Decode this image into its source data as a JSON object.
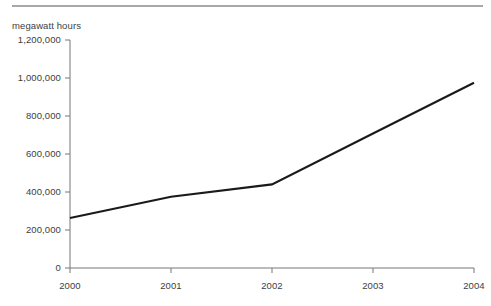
{
  "figure": {
    "background_color": "#ffffff",
    "rule_color": "#a8a8a8",
    "axis_color": "#777777",
    "line_color": "#1a1a1a",
    "text_color": "#3d3d3d"
  },
  "chart_data": {
    "type": "line",
    "title": "",
    "subtitle": "",
    "ylabel": "megawatt hours",
    "xlabel": "",
    "categories": [
      "2000",
      "2001",
      "2002",
      "2003",
      "2004"
    ],
    "x": [
      2000,
      2001,
      2002,
      2003,
      2004
    ],
    "values": [
      263000,
      375000,
      440000,
      708000,
      975000
    ],
    "series": [
      {
        "name": "megawatt hours",
        "values": [
          263000,
          375000,
          440000,
          708000,
          975000
        ]
      }
    ],
    "ylim": [
      0,
      1200000
    ],
    "xlim": [
      2000,
      2004
    ],
    "ytick_values": [
      0,
      200000,
      400000,
      600000,
      800000,
      1000000,
      1200000
    ],
    "ytick_labels": [
      "0",
      "200,000",
      "400,000",
      "600,000",
      "800,000",
      "1,000,000",
      "1,200,000"
    ],
    "xtick_values": [
      2000,
      2001,
      2002,
      2003,
      2004
    ],
    "xtick_labels": [
      "2000",
      "2001",
      "2002",
      "2003",
      "2004"
    ],
    "grid": false,
    "legend": false,
    "legend_position": "none",
    "annotations": []
  }
}
